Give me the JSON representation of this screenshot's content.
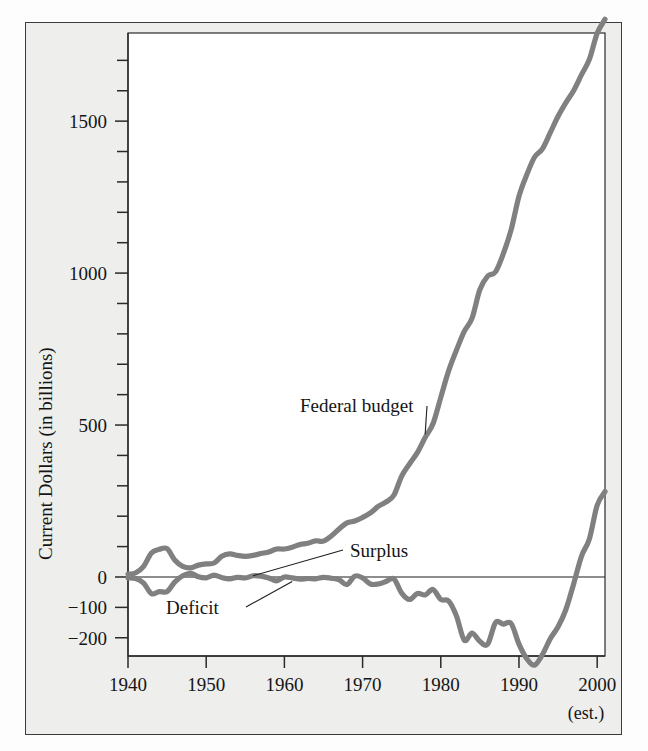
{
  "figure": {
    "background_color": "#eeeeec",
    "frame_color": "#3b3b3b",
    "series_color": "#808080",
    "text_color": "#151515"
  },
  "chart_data": {
    "type": "line",
    "title": "",
    "xlabel": "",
    "ylabel": "Current Dollars (in billions)",
    "xlim": [
      1940,
      2001
    ],
    "ylim": [
      -260,
      1790
    ],
    "grid": false,
    "legend": "inline-annotations",
    "x_ticks": [
      1940,
      1950,
      1960,
      1970,
      1980,
      1990,
      2000
    ],
    "x_tick_labels": [
      "1940",
      "1950",
      "1960",
      "1970",
      "1980",
      "1990",
      "2000"
    ],
    "x_minor_tick_step": 10,
    "x_note": "(est.)",
    "x_note_at": 2000,
    "y_ticks": [
      -200,
      -100,
      0,
      100,
      200,
      300,
      400,
      500,
      600,
      700,
      800,
      900,
      1000,
      1100,
      1200,
      1300,
      1400,
      1500,
      1600,
      1700
    ],
    "y_tick_labels_shown": [
      "-200",
      "-100",
      "0",
      "500",
      "1000",
      "1500"
    ],
    "y_labeled_values": [
      -200,
      -100,
      0,
      500,
      1000,
      1500
    ],
    "zero_line": 0,
    "series": [
      {
        "name": "Federal budget",
        "label": "Federal budget",
        "color": "#808080",
        "x": [
          1940,
          1941,
          1942,
          1943,
          1944,
          1945,
          1946,
          1947,
          1948,
          1949,
          1950,
          1951,
          1952,
          1953,
          1954,
          1955,
          1956,
          1957,
          1958,
          1959,
          1960,
          1961,
          1962,
          1963,
          1964,
          1965,
          1966,
          1967,
          1968,
          1969,
          1970,
          1971,
          1972,
          1973,
          1974,
          1975,
          1976,
          1977,
          1978,
          1979,
          1980,
          1981,
          1982,
          1983,
          1984,
          1985,
          1986,
          1987,
          1988,
          1989,
          1990,
          1991,
          1992,
          1993,
          1994,
          1995,
          1996,
          1997,
          1998,
          1999,
          2000,
          2001
        ],
        "values": [
          9,
          14,
          35,
          79,
          91,
          93,
          55,
          35,
          30,
          39,
          43,
          46,
          68,
          76,
          71,
          68,
          71,
          77,
          82,
          92,
          92,
          98,
          107,
          111,
          119,
          118,
          135,
          158,
          178,
          184,
          196,
          211,
          232,
          247,
          269,
          332,
          372,
          409,
          459,
          504,
          591,
          678,
          746,
          808,
          852,
          946,
          990,
          1004,
          1064,
          1143,
          1253,
          1324,
          1382,
          1409,
          1462,
          1516,
          1561,
          1601,
          1653,
          1703,
          1789,
          1835
        ]
      },
      {
        "name": "Deficit/Surplus",
        "label_surplus": "Surplus",
        "label_deficit": "Deficit",
        "color": "#808080",
        "x": [
          1940,
          1941,
          1942,
          1943,
          1944,
          1945,
          1946,
          1947,
          1948,
          1949,
          1950,
          1951,
          1952,
          1953,
          1954,
          1955,
          1956,
          1957,
          1958,
          1959,
          1960,
          1961,
          1962,
          1963,
          1964,
          1965,
          1966,
          1967,
          1968,
          1969,
          1970,
          1971,
          1972,
          1973,
          1974,
          1975,
          1976,
          1977,
          1978,
          1979,
          1980,
          1981,
          1982,
          1983,
          1984,
          1985,
          1986,
          1987,
          1988,
          1989,
          1990,
          1991,
          1992,
          1993,
          1994,
          1995,
          1996,
          1997,
          1998,
          1999,
          2000,
          2001
        ],
        "values": [
          -3,
          -5,
          -20,
          -55,
          -48,
          -48,
          -16,
          4,
          12,
          1,
          -3,
          6,
          -2,
          -6,
          -1,
          -3,
          4,
          3,
          -3,
          -13,
          0,
          -3,
          -7,
          -5,
          -6,
          -1,
          -4,
          -9,
          -25,
          3,
          -3,
          -23,
          -23,
          -15,
          -6,
          -53,
          -74,
          -54,
          -59,
          -41,
          -74,
          -79,
          -128,
          -208,
          -185,
          -212,
          -221,
          -150,
          -155,
          -153,
          -221,
          -269,
          -290,
          -255,
          -203,
          -164,
          -107,
          -22,
          69,
          125,
          236,
          281
        ]
      }
    ],
    "annotations": [
      {
        "text": "Federal budget",
        "points_to_year": 1978,
        "points_to_value": 470
      },
      {
        "text": "Surplus",
        "points_to_year": 1956,
        "points_to_value": 4
      },
      {
        "text": "Deficit",
        "points_to_year": 1961,
        "points_to_value": -15
      }
    ]
  }
}
